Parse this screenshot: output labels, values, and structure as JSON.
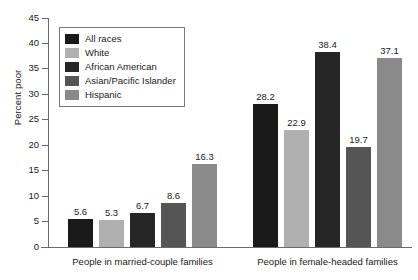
{
  "chart_data": {
    "type": "bar",
    "title": "",
    "xlabel": "",
    "ylabel": "Percent poor",
    "ylim": [
      0,
      45
    ],
    "yticks": [
      "0",
      "5",
      "10",
      "15",
      "20",
      "25",
      "30",
      "35",
      "40",
      "45"
    ],
    "grid": false,
    "legend_position": "upper-left-inside",
    "categories": [
      "People in married-couple families",
      "People in female-headed families"
    ],
    "series": [
      {
        "name": "All races",
        "color": "#1a1a1a",
        "values": [
          5.6,
          28.2
        ]
      },
      {
        "name": "White",
        "color": "#b0b0b0",
        "values": [
          5.3,
          22.9
        ]
      },
      {
        "name": "African American",
        "color": "#262626",
        "values": [
          6.7,
          38.4
        ]
      },
      {
        "name": "Asian/Pacific Islander",
        "color": "#555555",
        "values": [
          8.6,
          19.7
        ]
      },
      {
        "name": "Hispanic",
        "color": "#8a8a8a",
        "values": [
          16.3,
          37.1
        ]
      }
    ],
    "value_labels": {
      "group0": [
        "5.6",
        "5.3",
        "6.7",
        "8.6",
        "16.3"
      ],
      "group1": [
        "28.2",
        "22.9",
        "38.4",
        "19.7",
        "37.1"
      ]
    }
  },
  "axis": {
    "y_title": "Percent poor"
  },
  "legend": {
    "items": [
      {
        "label": "All races"
      },
      {
        "label": "White"
      },
      {
        "label": "African American"
      },
      {
        "label": "Asian/Pacific Islander"
      },
      {
        "label": "Hispanic"
      }
    ]
  }
}
